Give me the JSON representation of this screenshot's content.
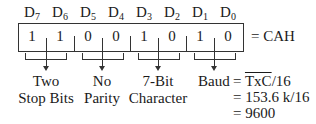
{
  "diagram": {
    "bit_headers": [
      {
        "name": "D",
        "sub": "7"
      },
      {
        "name": "D",
        "sub": "6"
      },
      {
        "name": "D",
        "sub": "5"
      },
      {
        "name": "D",
        "sub": "4"
      },
      {
        "name": "D",
        "sub": "3"
      },
      {
        "name": "D",
        "sub": "2"
      },
      {
        "name": "D",
        "sub": "1"
      },
      {
        "name": "D",
        "sub": "0"
      }
    ],
    "bit_values": [
      "1",
      "1",
      "0",
      "0",
      "1",
      "0",
      "1",
      "0"
    ],
    "result": "= CAH",
    "fields": [
      {
        "line1": "Two",
        "line2": "Stop Bits"
      },
      {
        "line1": "No",
        "line2": "Parity"
      },
      {
        "line1": "7-Bit",
        "line2": "Character"
      },
      {
        "line1": "Baud",
        "line2": ""
      }
    ],
    "baud_formula": {
      "eq1": "=",
      "signal": "TxC",
      "divisor1": "/16",
      "line2": "= 153.6 k/16",
      "line3": "= 9600"
    }
  }
}
